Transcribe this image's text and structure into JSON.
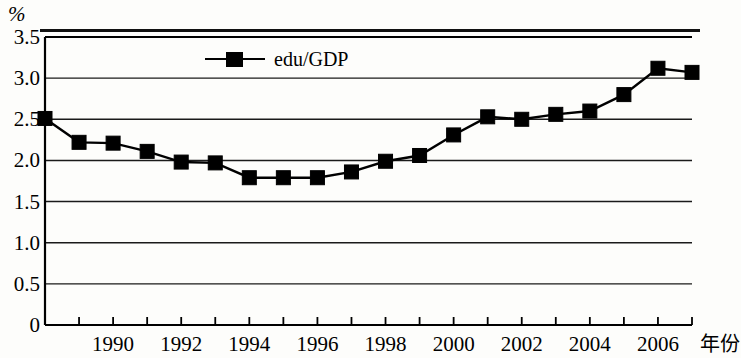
{
  "chart_data": {
    "type": "line",
    "title": "",
    "subtitle": "",
    "xlabel": "年份",
    "ylabel": "%",
    "ylim": [
      0,
      3.5
    ],
    "xlim": [
      1988,
      2007
    ],
    "grid": true,
    "legend_position": "top-center",
    "y_ticks": [
      "3.5",
      "3.0",
      "2.5",
      "2.0",
      "1.5",
      "1.0",
      "0.5",
      "0"
    ],
    "y_tick_values": [
      3.5,
      3.0,
      2.5,
      2.0,
      1.5,
      1.0,
      0.5,
      0
    ],
    "x_ticks": [
      "1990",
      "1992",
      "1994",
      "1996",
      "1998",
      "2000",
      "2002",
      "2004",
      "2006"
    ],
    "x_tick_values": [
      1990,
      1992,
      1994,
      1996,
      1998,
      2000,
      2002,
      2004,
      2006
    ],
    "marker": "filled-square",
    "series": [
      {
        "name": "edu/GDP",
        "color": "#000000",
        "x": [
          1988,
          1989,
          1990,
          1991,
          1992,
          1993,
          1994,
          1995,
          1996,
          1997,
          1998,
          1999,
          2000,
          2001,
          2002,
          2003,
          2004,
          2005,
          2006,
          2007
        ],
        "values": [
          2.51,
          2.22,
          2.21,
          2.11,
          1.98,
          1.97,
          1.79,
          1.79,
          1.79,
          1.86,
          1.99,
          2.06,
          2.31,
          2.53,
          2.5,
          2.56,
          2.6,
          2.8,
          3.12,
          3.07
        ]
      }
    ]
  },
  "legend": {
    "entries": [
      {
        "label": "edu/GDP"
      }
    ]
  },
  "axis": {
    "y_unit": "%",
    "x_name": "年份"
  }
}
